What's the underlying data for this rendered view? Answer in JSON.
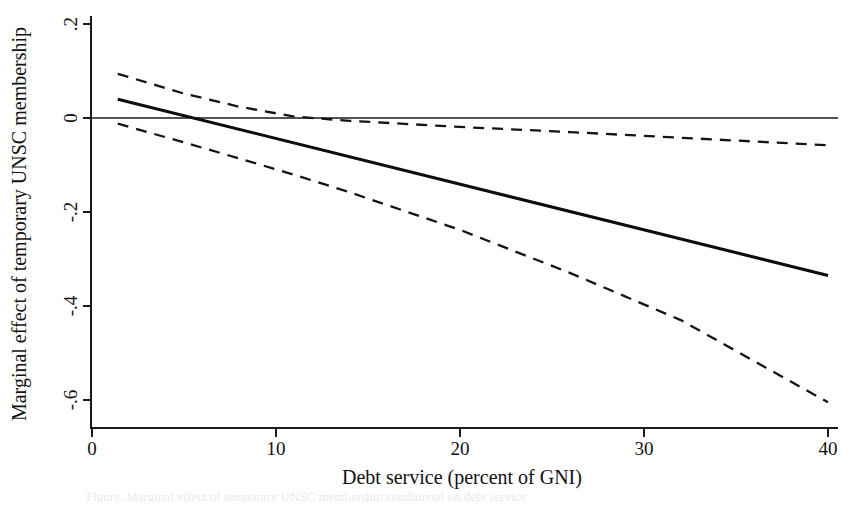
{
  "figure": {
    "name": "marginal-effect-plot",
    "caption_fragment": "Figure. Marginal effect of temporary UNSC membership conditional on debt service."
  },
  "chart_data": {
    "type": "line",
    "title": "",
    "subtitle": "",
    "xlabel": "Debt service (percent of GNI)",
    "ylabel": "Marginal effect of temporary UNSC membership",
    "xlim": [
      0,
      40
    ],
    "ylim": [
      -0.7,
      0.22
    ],
    "xticks": [
      0,
      10,
      20,
      30,
      40
    ],
    "xticklabels": [
      "0",
      "10",
      "20",
      "30",
      "40"
    ],
    "yticks": [
      0.2,
      0,
      -0.2,
      -0.4,
      -0.6
    ],
    "yticklabels": [
      ".2",
      "0",
      "-.2",
      "-.4",
      "-.6"
    ],
    "grid": false,
    "legend": "none",
    "reference_lines": [
      {
        "name": "zero-reference-line",
        "orientation": "horizontal",
        "value": 0,
        "style": "solid"
      }
    ],
    "series": [
      {
        "name": "Marginal effect (point estimate)",
        "style": "solid",
        "x": [
          1.4,
          40.0
        ],
        "values": [
          0.04,
          -0.335
        ]
      },
      {
        "name": "Upper 95% confidence bound",
        "style": "dashed",
        "x": [
          1.4,
          5.0,
          8.0,
          11.0,
          14.0,
          20.0,
          26.0,
          32.0,
          40.0
        ],
        "values": [
          0.094,
          0.052,
          0.024,
          0.003,
          -0.006,
          -0.019,
          -0.03,
          -0.042,
          -0.058
        ]
      },
      {
        "name": "Lower 95% confidence bound",
        "style": "dashed",
        "x": [
          1.4,
          5.0,
          8.0,
          11.0,
          14.0,
          20.0,
          26.0,
          32.0,
          40.0
        ],
        "values": [
          -0.012,
          -0.052,
          -0.086,
          -0.121,
          -0.158,
          -0.238,
          -0.33,
          -0.43,
          -0.605
        ]
      }
    ]
  },
  "axis": {
    "x_title": "Debt service (percent of GNI)",
    "y_title": "Marginal effect of temporary UNSC membership",
    "x_tick_labels": [
      "0",
      "10",
      "20",
      "30",
      "40"
    ],
    "y_tick_labels": [
      ".2",
      "0",
      "-.2",
      "-.4",
      "-.6"
    ]
  },
  "colors": {
    "ink": "#111111",
    "background": "#ffffff"
  }
}
